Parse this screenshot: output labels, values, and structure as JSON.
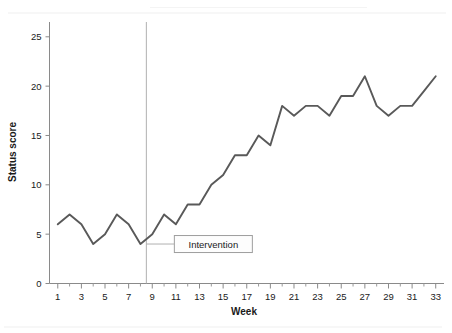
{
  "chart_data": {
    "type": "line",
    "title": "",
    "subtitle": "",
    "xlabel": "Week",
    "ylabel": "Status score",
    "xlim": [
      0.3,
      33.7
    ],
    "ylim": [
      0,
      26.5
    ],
    "grid": false,
    "legend": "none",
    "x": [
      1,
      2,
      3,
      4,
      5,
      6,
      7,
      8,
      9,
      10,
      11,
      12,
      13,
      14,
      15,
      16,
      17,
      18,
      19,
      20,
      21,
      22,
      23,
      24,
      25,
      26,
      27,
      28,
      29,
      30,
      31,
      32,
      33
    ],
    "values": [
      6,
      7,
      6,
      4,
      5,
      7,
      6,
      4,
      5,
      7,
      6,
      8,
      8,
      10,
      11,
      13,
      13,
      15,
      14,
      18,
      17,
      18,
      18,
      17,
      19,
      19,
      21,
      18,
      17,
      18,
      18,
      19.5,
      21
    ],
    "series": [
      {
        "name": "Status score",
        "color": "#595959",
        "values": [
          6,
          7,
          6,
          4,
          5,
          7,
          6,
          4,
          5,
          7,
          6,
          8,
          8,
          10,
          11,
          13,
          13,
          15,
          14,
          18,
          17,
          18,
          18,
          17,
          19,
          19,
          21,
          18,
          17,
          18,
          18,
          19.5,
          21
        ]
      }
    ],
    "y_ticks": [
      0,
      5,
      10,
      15,
      20,
      25
    ],
    "y_tick_labels": [
      "0",
      "5",
      "10",
      "15",
      "20",
      "25"
    ],
    "x_ticks": [
      1,
      3,
      5,
      7,
      9,
      11,
      13,
      15,
      17,
      19,
      21,
      23,
      25,
      27,
      29,
      31,
      33
    ],
    "x_tick_labels": [
      "1",
      "3",
      "5",
      "7",
      "9",
      "11",
      "13",
      "15",
      "17",
      "19",
      "21",
      "23",
      "25",
      "27",
      "29",
      "31",
      "33"
    ],
    "x_minor_ticks": [
      2,
      4,
      6,
      8,
      10,
      12,
      14,
      16,
      18,
      20,
      22,
      24,
      26,
      28,
      30,
      32
    ],
    "annotations": [
      {
        "name": "intervention",
        "label": "Intervention",
        "type": "vertical-line-with-label",
        "x": 8.5,
        "label_y": 4,
        "line_color": "#b0b0b0"
      }
    ],
    "colors": {
      "series": "#595959",
      "axis": "#8a8a8a",
      "text": "#1a1a1a",
      "event_line": "#b0b0b0",
      "background": "#ffffff"
    }
  },
  "axis": {
    "y_title": "Status score",
    "x_title": "Week"
  },
  "annotation": {
    "intervention_label": "Intervention"
  }
}
